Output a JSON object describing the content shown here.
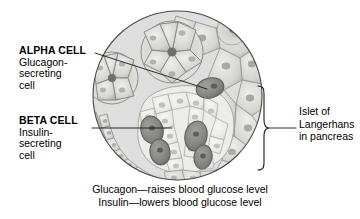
{
  "figure": {
    "type": "histology-micrograph",
    "subject": "Islet of Langerhans in pancreas",
    "view": "circular microscope field"
  },
  "labels": {
    "alpha": {
      "title": "ALPHA CELL",
      "line1": "Glucagon-",
      "line2": "secreting",
      "line3": "cell"
    },
    "beta": {
      "title": "BETA CELL",
      "line1": "Insulin-",
      "line2": "secreting",
      "line3": "cell"
    },
    "islet": {
      "line1": "Islet of",
      "line2": "Langerhans",
      "line3": "in pancreas"
    }
  },
  "caption": {
    "line1": "Glucagon—raises blood glucose level",
    "line2": "Insulin—lowers blood glucose level"
  },
  "colors": {
    "background": "#ffffff",
    "text": "#000000",
    "leader_line": "#1a1a1a",
    "circle_outline": "#4a4a4a",
    "tissue_light": "#e8e8e6",
    "tissue_mid": "#c9c9c6",
    "tissue_dark": "#8f8f8c",
    "cell_dark_stain": "#7a7a78",
    "islet_pale": "#efefed"
  }
}
